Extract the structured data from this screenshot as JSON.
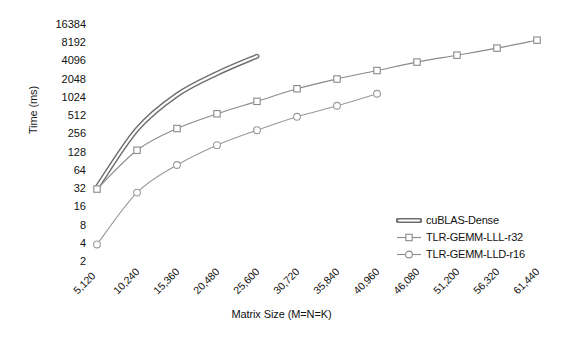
{
  "chart_data": {
    "type": "line",
    "title": "",
    "xlabel": "Matrix Size (M=N=K)",
    "ylabel": "Time (ms)",
    "yscale": "log2",
    "ylim": [
      2,
      16384
    ],
    "yticks": [
      16384,
      8192,
      4096,
      2048,
      1024,
      512,
      256,
      128,
      64,
      32,
      16,
      8,
      4,
      2
    ],
    "ytick_labels": [
      "16384",
      "8192",
      "4096",
      "2048",
      "1024",
      "512",
      "256",
      "128",
      "64",
      "32",
      "16",
      "8",
      "4",
      "2"
    ],
    "categories": [
      5120,
      10240,
      15360,
      20480,
      25600,
      30720,
      35840,
      40960,
      46080,
      51200,
      56320,
      61440
    ],
    "xtick_labels": [
      "5,120",
      "10,240",
      "15,360",
      "20,480",
      "25,600",
      "30,720",
      "35,840",
      "40,960",
      "46,080",
      "51,200",
      "56,320",
      "61,440"
    ],
    "grid": false,
    "legend_position": "lower-right",
    "series": [
      {
        "name": "cuBLAS-Dense",
        "marker": "none",
        "style": "thick-band",
        "color": "#808080",
        "x": [
          5120,
          10240,
          15360,
          20480,
          25600
        ],
        "values": [
          34,
          310,
          1150,
          2600,
          5000
        ]
      },
      {
        "name": "TLR-GEMM-LLL-r32",
        "marker": "square",
        "style": "thin-line",
        "color": "#8a8a8a",
        "x": [
          5120,
          10240,
          15360,
          20480,
          25600,
          30720,
          35840,
          40960,
          46080,
          51200,
          56320,
          61440
        ],
        "values": [
          32,
          140,
          320,
          560,
          900,
          1450,
          2100,
          2900,
          4000,
          5200,
          6800,
          9200
        ]
      },
      {
        "name": "TLR-GEMM-LLD-r16",
        "marker": "circle",
        "style": "thin-line",
        "color": "#9a9a9a",
        "x": [
          5120,
          10240,
          15360,
          20480,
          25600,
          30720,
          35840,
          40960
        ],
        "values": [
          3.9,
          28,
          80,
          170,
          300,
          500,
          760,
          1200
        ]
      }
    ]
  },
  "legend": {
    "items": [
      {
        "label": "cuBLAS-Dense",
        "marker": "none"
      },
      {
        "label": "TLR-GEMM-LLL-r32",
        "marker": "square"
      },
      {
        "label": "TLR-GEMM-LLD-r16",
        "marker": "circle"
      }
    ]
  },
  "colors": {
    "line_gray": "#8a8a8a",
    "text": "#111111",
    "background": "#ffffff"
  }
}
